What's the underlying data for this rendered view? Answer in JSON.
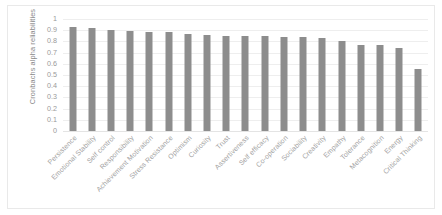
{
  "chart_data": {
    "type": "bar",
    "title": "",
    "xlabel": "",
    "ylabel": "Cronbachs alpha reliabilities",
    "ylim": [
      0,
      1
    ],
    "ytick_labels": [
      "1",
      "0.9",
      "0.8",
      "0.7",
      "0.6",
      "0.5",
      "0.4",
      "0.3",
      "0.2",
      "0.1",
      "0"
    ],
    "ytick_values": [
      1,
      0.9,
      0.8,
      0.7,
      0.6,
      0.5,
      0.4,
      0.3,
      0.2,
      0.1,
      0
    ],
    "grid": true,
    "legend": false,
    "bar_color": "#8d8d8d",
    "categories": [
      "Persistence",
      "Emotional Stability",
      "Self control",
      "Responsibility",
      "Achievement Motivation",
      "Stress Resistance",
      "Optimism",
      "Curiosity",
      "Trust",
      "Assertiveness",
      "Self efficacy",
      "Co-operation",
      "Sociability",
      "Creativity",
      "Empathy",
      "Tolerance",
      "Metacognition",
      "Energy",
      "Critical Thinking"
    ],
    "values": [
      0.93,
      0.92,
      0.9,
      0.89,
      0.88,
      0.88,
      0.87,
      0.86,
      0.85,
      0.85,
      0.85,
      0.84,
      0.84,
      0.83,
      0.8,
      0.77,
      0.77,
      0.74,
      0.55
    ]
  }
}
